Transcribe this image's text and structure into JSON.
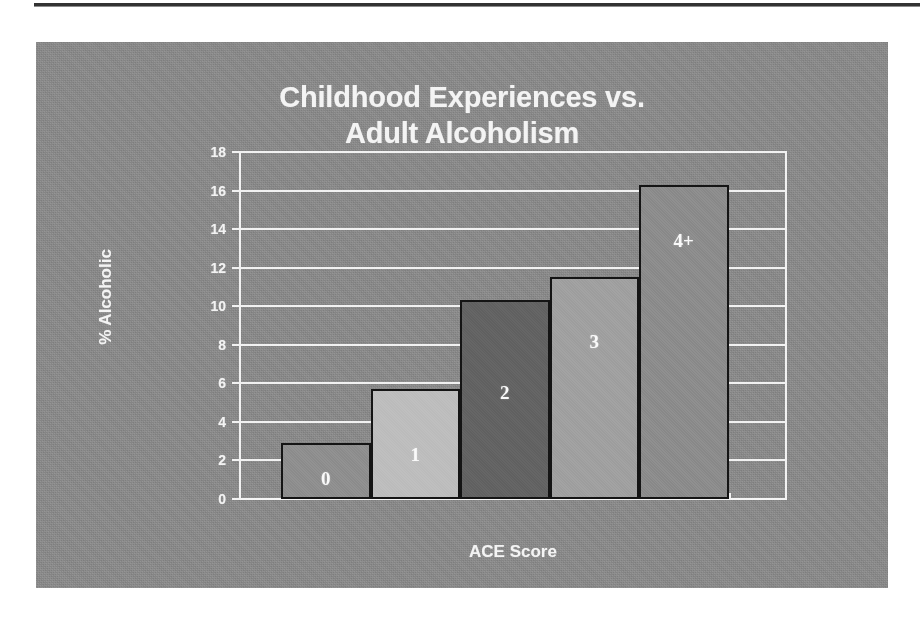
{
  "page": {
    "background_color": "#ffffff",
    "panel_color": "#8a8a8a",
    "rule_color": "#333333"
  },
  "chart_data": {
    "type": "bar",
    "title": "Childhood Experiences vs. Adult Alcoholism",
    "title_line1": "Childhood Experiences vs.",
    "title_line2": "Adult Alcoholism",
    "xlabel": "ACE Score",
    "ylabel": "% Alcoholic",
    "categories": [
      "0",
      "1",
      "2",
      "3",
      "4+"
    ],
    "values": [
      2.9,
      5.7,
      10.3,
      11.5,
      16.3
    ],
    "ylim": [
      0,
      18
    ],
    "ytick_values": [
      0,
      2,
      4,
      6,
      8,
      10,
      12,
      14,
      16,
      18
    ],
    "ytick_labels": [
      "0",
      "2",
      "4",
      "6",
      "8",
      "10",
      "12",
      "14",
      "16",
      "18"
    ],
    "grid": true,
    "grid_color": "#f2f2f2",
    "grid_orientation": "horizontal",
    "legend": null,
    "bar_outline_color": "#141414",
    "bar_label_color": "#fafafa",
    "bars": [
      {
        "category": "0",
        "value": 2.9,
        "fill": "#8f8f8f",
        "label": "0",
        "label_offset_pct": 12
      },
      {
        "category": "1",
        "value": 5.7,
        "fill": "#bdbdbd",
        "label": "1",
        "label_offset_pct": 28
      },
      {
        "category": "2",
        "value": 10.3,
        "fill": "#636363",
        "label": "2",
        "label_offset_pct": 47
      },
      {
        "category": "3",
        "value": 11.5,
        "fill": "#a0a0a0",
        "label": "3",
        "label_offset_pct": 65
      },
      {
        "category": "4+",
        "value": 16.3,
        "fill": "#8c8c8c",
        "label": "4+",
        "label_offset_pct": 78
      }
    ]
  }
}
